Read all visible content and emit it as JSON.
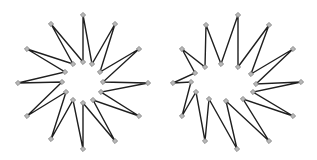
{
  "colors": {
    "background": "#ffffff",
    "edge": "#1f1f1f",
    "marker_fill": "#b8b8b8",
    "marker_stroke": "#6e6e6e"
  },
  "marker_shape": "diamond",
  "shapes": [
    {
      "name": "regular-star",
      "description": "12-point star polygon, evenly spaced vertices",
      "vertices": [
        [
          83,
          15
        ],
        [
          92,
          64
        ],
        [
          115,
          24
        ],
        [
          100,
          72
        ],
        [
          139,
          49
        ],
        [
          103,
          82
        ],
        [
          148,
          83
        ],
        [
          101,
          92
        ],
        [
          139,
          116
        ],
        [
          93,
          100
        ],
        [
          115,
          141
        ],
        [
          83,
          103
        ],
        [
          83,
          149
        ],
        [
          73,
          100
        ],
        [
          51,
          139
        ],
        [
          66,
          92
        ],
        [
          27,
          116
        ],
        [
          62,
          82
        ],
        [
          18,
          83
        ],
        [
          65,
          72
        ],
        [
          27,
          49
        ],
        [
          73,
          64
        ],
        [
          51,
          24
        ],
        [
          83,
          62
        ]
      ]
    },
    {
      "name": "distorted-star",
      "description": "12-point star polygon with irregular inner vertices",
      "vertices": [
        [
          238,
          15
        ],
        [
          238,
          67
        ],
        [
          269,
          25
        ],
        [
          251,
          74
        ],
        [
          293,
          49
        ],
        [
          256,
          84
        ],
        [
          301,
          82
        ],
        [
          253,
          92
        ],
        [
          293,
          116
        ],
        [
          243,
          99
        ],
        [
          269,
          141
        ],
        [
          226,
          101
        ],
        [
          237,
          149
        ],
        [
          209,
          99
        ],
        [
          205,
          141
        ],
        [
          196,
          92
        ],
        [
          182,
          116
        ],
        [
          191,
          82
        ],
        [
          173,
          83
        ],
        [
          195,
          73
        ],
        [
          182,
          49
        ],
        [
          205,
          67
        ],
        [
          206,
          25
        ],
        [
          221,
          64
        ]
      ]
    }
  ]
}
